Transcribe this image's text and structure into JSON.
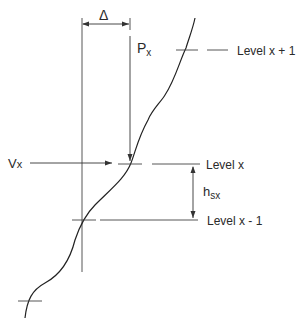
{
  "diagram": {
    "delta_label": "Δ",
    "px_label": {
      "main": "P",
      "sub": "x"
    },
    "vx_label": {
      "main": "V",
      "sub": "x"
    },
    "hsx_label": {
      "main": "h",
      "sub": "sx"
    },
    "levels": [
      {
        "id": "level-x-plus-1",
        "label": "Level x + 1"
      },
      {
        "id": "level-x",
        "label": "Level x"
      },
      {
        "id": "level-x-minus-1",
        "label": "Level x - 1"
      }
    ],
    "colors": {
      "line": "#333333",
      "text": "#2a2a2a",
      "background": "#ffffff"
    }
  }
}
